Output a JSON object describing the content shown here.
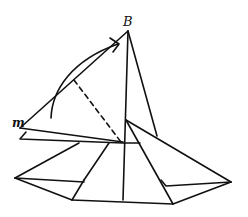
{
  "diagram": {
    "title": "",
    "labels": {
      "apex": "B",
      "left_point": "m"
    },
    "stroke_color": "#111111",
    "background": "#ffffff",
    "elements": [
      {
        "type": "fold-arrow",
        "description": "curved arrow from m toward B"
      },
      {
        "type": "dashed-line",
        "description": "valley fold line"
      },
      {
        "type": "flap",
        "description": "triangular flap m-B being folded"
      },
      {
        "type": "base",
        "description": "layered origami base shape"
      }
    ]
  }
}
